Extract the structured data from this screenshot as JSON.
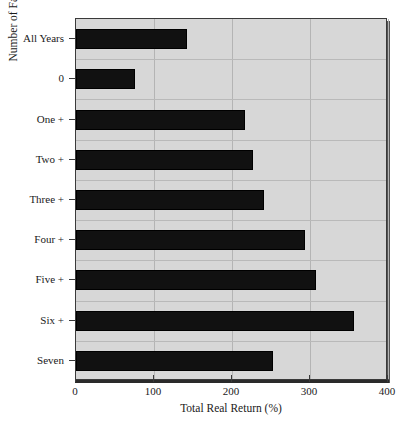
{
  "chart_data": {
    "type": "bar",
    "orientation": "horizontal",
    "title": "",
    "xlabel": "Total Real Return (%)",
    "ylabel": "Number of Factors",
    "categories": [
      "All Years",
      "0",
      "One +",
      "Two +",
      "Three +",
      "Four +",
      "Five +",
      "Six +",
      "Seven"
    ],
    "values": [
      142,
      76,
      217,
      227,
      241,
      293,
      308,
      356,
      252
    ],
    "xlim": [
      0,
      400
    ],
    "xticks": [
      0,
      100,
      200,
      300,
      400
    ],
    "xtick_labels": [
      "0",
      "100",
      "200",
      "300",
      "400"
    ],
    "grid": true,
    "grid_axis": "both",
    "legend": false,
    "bar_color": "#111111",
    "plot_background": "#d7d7d7",
    "grid_color": "#b4b4b4",
    "axis_color": "#2a2a2a"
  },
  "axes": {
    "x_title": "Total Real Return (%)",
    "y_title": "Number of Factors"
  }
}
